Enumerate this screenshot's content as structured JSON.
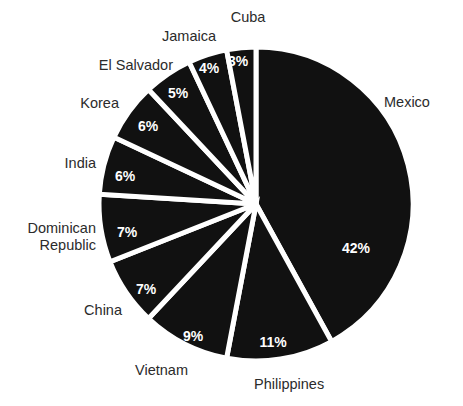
{
  "figure": {
    "background_color": "#ffffff",
    "slice_color": "#111111",
    "separator_color": "#ffffff",
    "label_color": "#2b2b2b",
    "percent_label_color": "#ffffff"
  },
  "chart_data": {
    "type": "pie",
    "title": "",
    "subtitle": "",
    "xlabel": "",
    "ylabel": "",
    "grid": false,
    "legend_position": "outside-labels",
    "start_angle_deg": 0,
    "direction": "clockwise",
    "center": {
      "x": 256,
      "y": 204
    },
    "radius": 157,
    "categories": [
      "Mexico",
      "Philippines",
      "Vietnam",
      "China",
      "Dominican Republic",
      "India",
      "Korea",
      "El Salvador",
      "Jamaica",
      "Cuba"
    ],
    "values": [
      42,
      11,
      9,
      7,
      7,
      6,
      6,
      5,
      4,
      3
    ],
    "value_labels": [
      "42%",
      "11%",
      "9%",
      "7%",
      "7%",
      "6%",
      "6%",
      "5%",
      "4%",
      "3%"
    ],
    "units": "percent",
    "total": 100
  },
  "slices": [
    {
      "name": "Mexico",
      "value": 42,
      "percent_label": "42%",
      "category_label": "Mexico",
      "category_label_lines": [
        "Mexico"
      ],
      "start_deg": 0,
      "end_deg": 151.2,
      "percent_label_pos": {
        "x": 356,
        "y": 249
      },
      "category_label_pos": {
        "x": 384,
        "y": 103
      },
      "category_anchor": "start"
    },
    {
      "name": "Philippines",
      "value": 11,
      "percent_label": "11%",
      "category_label": "Philippines",
      "category_label_lines": [
        "Philippines"
      ],
      "start_deg": 151.2,
      "end_deg": 190.8,
      "percent_label_pos": {
        "x": 273,
        "y": 343
      },
      "category_label_pos": {
        "x": 254,
        "y": 385
      },
      "category_anchor": "start"
    },
    {
      "name": "Vietnam",
      "value": 9,
      "percent_label": "9%",
      "category_label": "Vietnam",
      "category_label_lines": [
        "Vietnam"
      ],
      "start_deg": 190.8,
      "end_deg": 223.2,
      "percent_label_pos": {
        "x": 193,
        "y": 337
      },
      "category_label_pos": {
        "x": 188,
        "y": 371
      },
      "category_anchor": "end"
    },
    {
      "name": "China",
      "value": 7,
      "percent_label": "7%",
      "category_label": "China",
      "category_label_lines": [
        "China"
      ],
      "start_deg": 223.2,
      "end_deg": 248.4,
      "percent_label_pos": {
        "x": 146,
        "y": 290
      },
      "category_label_pos": {
        "x": 122,
        "y": 311
      },
      "category_anchor": "end"
    },
    {
      "name": "Dominican Republic",
      "value": 7,
      "percent_label": "7%",
      "category_label": "Dominican Republic",
      "category_label_lines": [
        "Dominican",
        "Republic"
      ],
      "start_deg": 248.4,
      "end_deg": 273.6,
      "percent_label_pos": {
        "x": 127,
        "y": 233
      },
      "category_label_pos": {
        "x": 96,
        "y": 229
      },
      "category_anchor": "end"
    },
    {
      "name": "India",
      "value": 6,
      "percent_label": "6%",
      "category_label": "India",
      "category_label_lines": [
        "India"
      ],
      "start_deg": 273.6,
      "end_deg": 295.2,
      "percent_label_pos": {
        "x": 125,
        "y": 177
      },
      "category_label_pos": {
        "x": 96,
        "y": 164
      },
      "category_anchor": "end"
    },
    {
      "name": "Korea",
      "value": 6,
      "percent_label": "6%",
      "category_label": "Korea",
      "category_label_lines": [
        "Korea"
      ],
      "start_deg": 295.2,
      "end_deg": 316.8,
      "percent_label_pos": {
        "x": 148,
        "y": 127
      },
      "category_label_pos": {
        "x": 119,
        "y": 104
      },
      "category_anchor": "end"
    },
    {
      "name": "El Salvador",
      "value": 5,
      "percent_label": "5%",
      "category_label": "El Salvador",
      "category_label_lines": [
        "El Salvador"
      ],
      "start_deg": 316.8,
      "end_deg": 334.8,
      "percent_label_pos": {
        "x": 178,
        "y": 94
      },
      "category_label_pos": {
        "x": 173,
        "y": 66
      },
      "category_anchor": "end"
    },
    {
      "name": "Jamaica",
      "value": 4,
      "percent_label": "4%",
      "category_label": "Jamaica",
      "category_label_lines": [
        "Jamaica"
      ],
      "start_deg": 334.8,
      "end_deg": 349.2,
      "percent_label_pos": {
        "x": 209,
        "y": 69
      },
      "category_label_pos": {
        "x": 216,
        "y": 37
      },
      "category_anchor": "end"
    },
    {
      "name": "Cuba",
      "value": 3,
      "percent_label": "3%",
      "category_label": "Cuba",
      "category_label_lines": [
        "Cuba"
      ],
      "start_deg": 349.2,
      "end_deg": 360,
      "percent_label_pos": {
        "x": 238,
        "y": 62
      },
      "category_label_pos": {
        "x": 248,
        "y": 18
      },
      "category_anchor": "middle"
    }
  ]
}
